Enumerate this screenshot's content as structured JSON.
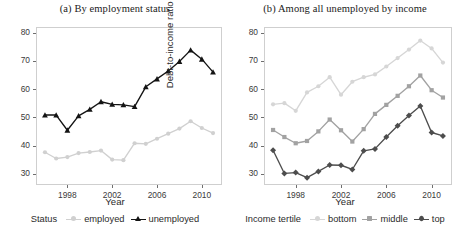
{
  "figure": {
    "width": 460,
    "height": 240,
    "background": "#ffffff"
  },
  "panels": [
    {
      "id": "panel-a",
      "title": "(a) By employment status",
      "xlabel": "Year",
      "ylabel": "Debt-to-income ratio (%)",
      "legend_title": "Status"
    },
    {
      "id": "panel-b",
      "title": "(b) Among all unemployed by income",
      "xlabel": "Year",
      "ylabel": "Debt-to-income ratio (%)",
      "legend_title": "Income tertile"
    }
  ],
  "axes": {
    "ytick_labels": [
      "80",
      "70",
      "60",
      "50",
      "40",
      "30"
    ],
    "xtick_labels": [
      "1998",
      "2002",
      "2006",
      "2010"
    ],
    "ylim": [
      26,
      82
    ],
    "xlim": [
      1995.2,
      2011.8
    ],
    "ytick_values": [
      80,
      70,
      60,
      50,
      40,
      30
    ],
    "xtick_values": [
      1998,
      2002,
      2006,
      2010
    ],
    "grid": false
  },
  "colors": {
    "employed": "#d0d0d0",
    "unemployed": "#141414",
    "bottom": "#d6d6d6",
    "middle": "#a2a2a2",
    "top": "#4d4d4d",
    "panel_border": "#cfcfcf",
    "axis_text": "#3a3a3a",
    "title_text": "#1a1a1a"
  },
  "chart_data": [
    {
      "type": "line",
      "title": "(a) By employment status",
      "xlabel": "Year",
      "ylabel": "Debt-to-income ratio (%)",
      "xlim": [
        1995.2,
        2011.8
      ],
      "ylim": [
        26,
        82
      ],
      "grid": false,
      "legend_position": "bottom",
      "legend_title": "Status",
      "x": [
        1996,
        1997,
        1998,
        1999,
        2000,
        2001,
        2002,
        2003,
        2004,
        2005,
        2006,
        2007,
        2008,
        2009,
        2010,
        2011
      ],
      "series": [
        {
          "name": "employed",
          "marker": "circle",
          "color": "#d0d0d0",
          "values": [
            37.6,
            35.4,
            35.9,
            37.3,
            37.7,
            38.2,
            35.0,
            34.8,
            40.8,
            40.6,
            42.4,
            44.2,
            46.0,
            48.6,
            46.2,
            44.4
          ]
        },
        {
          "name": "unemployed",
          "marker": "triangle",
          "color": "#141414",
          "values": [
            50.8,
            50.8,
            45.4,
            50.5,
            52.8,
            55.5,
            54.6,
            54.4,
            53.8,
            60.8,
            63.6,
            66.4,
            69.8,
            73.8,
            70.6,
            66.0
          ]
        }
      ]
    },
    {
      "type": "line",
      "title": "(b) Among all unemployed by income",
      "xlabel": "Year",
      "ylabel": "Debt-to-income ratio (%)",
      "xlim": [
        1995.2,
        2011.8
      ],
      "ylim": [
        26,
        82
      ],
      "grid": false,
      "legend_position": "bottom",
      "legend_title": "Income tertile",
      "x": [
        1996,
        1997,
        1998,
        1999,
        2000,
        2001,
        2002,
        2003,
        2004,
        2005,
        2006,
        2007,
        2008,
        2009,
        2010,
        2011
      ],
      "series": [
        {
          "name": "bottom",
          "marker": "circle",
          "color": "#d6d6d6",
          "values": [
            54.6,
            55.0,
            52.3,
            58.8,
            61.0,
            64.2,
            58.0,
            62.6,
            64.2,
            65.2,
            68.0,
            71.0,
            74.0,
            77.2,
            74.4,
            69.4
          ]
        },
        {
          "name": "middle",
          "marker": "square",
          "color": "#a2a2a2",
          "values": [
            45.5,
            43.0,
            40.8,
            41.6,
            45.0,
            49.2,
            45.4,
            41.4,
            45.8,
            51.2,
            54.4,
            57.6,
            61.0,
            64.8,
            59.6,
            57.0
          ]
        },
        {
          "name": "top",
          "marker": "diamond",
          "color": "#4d4d4d",
          "values": [
            38.3,
            30.1,
            30.4,
            28.6,
            30.8,
            33.1,
            33.0,
            31.5,
            38.1,
            38.8,
            43.0,
            47.0,
            50.6,
            54.0,
            44.6,
            43.4
          ]
        }
      ]
    }
  ]
}
